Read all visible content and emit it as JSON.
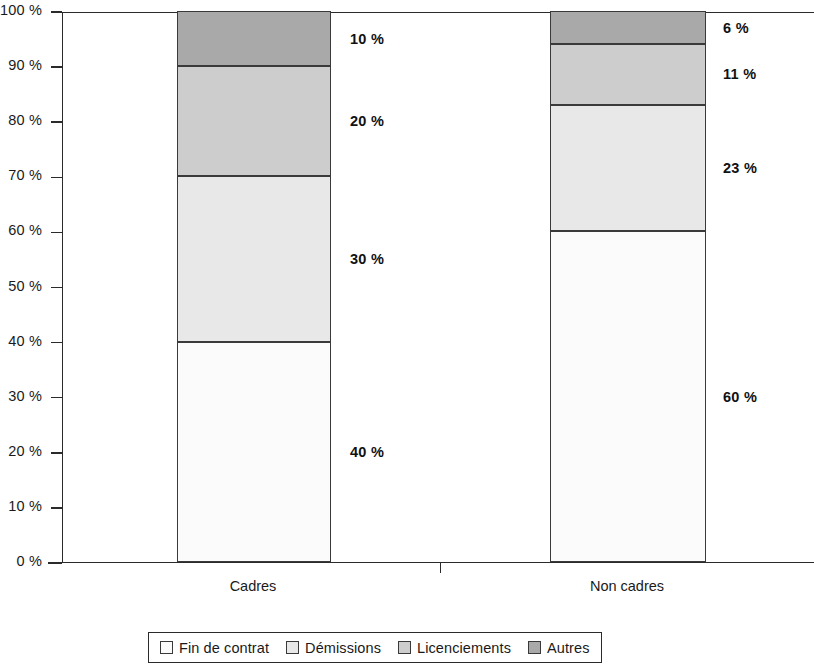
{
  "chart_data": {
    "type": "bar",
    "subtype": "stacked-100-percent",
    "title": "",
    "xlabel": "",
    "ylabel": "",
    "categories": [
      "Cadres",
      "Non cadres"
    ],
    "series": [
      {
        "name": "Fin de contrat",
        "values": [
          40,
          60
        ],
        "color": "#fbfbfb"
      },
      {
        "name": "Démissions",
        "values": [
          30,
          23
        ],
        "color": "#e8e8e8"
      },
      {
        "name": "Licenciements",
        "values": [
          20,
          11
        ],
        "color": "#cdcdcd"
      },
      {
        "name": "Autres",
        "values": [
          10,
          6
        ],
        "color": "#a9a9a9"
      }
    ],
    "data_labels": [
      [
        "40 %",
        "30 %",
        "20 %",
        "10 %"
      ],
      [
        "60 %",
        "23 %",
        "11 %",
        "6 %"
      ]
    ],
    "ylim": [
      0,
      100
    ],
    "y_ticks": [
      "0 %",
      "10 %",
      "20 %",
      "30 %",
      "40 %",
      "50 %",
      "60 %",
      "70 %",
      "80 %",
      "90 %",
      "100 %"
    ],
    "y_tick_values": [
      0,
      10,
      20,
      30,
      40,
      50,
      60,
      70,
      80,
      90,
      100
    ],
    "grid": false,
    "legend_position": "bottom"
  },
  "axis": {
    "ticks": [
      {
        "label": "100 %",
        "value": 100
      },
      {
        "label": "90 %",
        "value": 90
      },
      {
        "label": "80 %",
        "value": 80
      },
      {
        "label": "70 %",
        "value": 70
      },
      {
        "label": "60 %",
        "value": 60
      },
      {
        "label": "50 %",
        "value": 50
      },
      {
        "label": "40 %",
        "value": 40
      },
      {
        "label": "30 %",
        "value": 30
      },
      {
        "label": "20 %",
        "value": 20
      },
      {
        "label": "10 %",
        "value": 10
      },
      {
        "label": "0 %",
        "value": 0
      }
    ]
  },
  "bars": [
    {
      "category": "Cadres",
      "segments": [
        {
          "name": "Autres",
          "value": 10,
          "label": "10 %",
          "color": "#a9a9a9"
        },
        {
          "name": "Licenciements",
          "value": 20,
          "label": "20 %",
          "color": "#cdcdcd"
        },
        {
          "name": "Démissions",
          "value": 30,
          "label": "30 %",
          "color": "#e8e8e8"
        },
        {
          "name": "Fin de contrat",
          "value": 40,
          "label": "40 %",
          "color": "#fbfbfb"
        }
      ]
    },
    {
      "category": "Non cadres",
      "segments": [
        {
          "name": "Autres",
          "value": 6,
          "label": "6 %",
          "color": "#a9a9a9"
        },
        {
          "name": "Licenciements",
          "value": 11,
          "label": "11 %",
          "color": "#cdcdcd"
        },
        {
          "name": "Démissions",
          "value": 23,
          "label": "23 %",
          "color": "#e8e8e8"
        },
        {
          "name": "Fin de contrat",
          "value": 60,
          "label": "60 %",
          "color": "#fbfbfb"
        }
      ]
    }
  ],
  "legend": {
    "items": [
      {
        "label": "Fin de contrat",
        "color": "#fbfbfb"
      },
      {
        "label": "Démissions",
        "color": "#e8e8e8"
      },
      {
        "label": "Licenciements",
        "color": "#cdcdcd"
      },
      {
        "label": "Autres",
        "color": "#a9a9a9"
      }
    ]
  }
}
